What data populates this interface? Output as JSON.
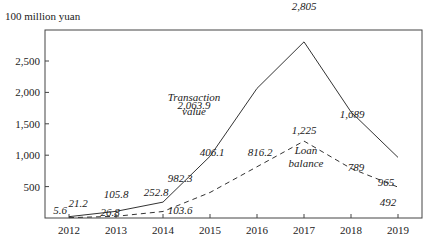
{
  "chart_data": {
    "type": "line",
    "title": "",
    "ylabel": "100 million yuan",
    "xlabel": "",
    "categories": [
      "2012",
      "2013",
      "2014",
      "2015",
      "2016",
      "2017",
      "2018",
      "2019"
    ],
    "yticks": [
      500,
      1000,
      1500,
      2000,
      2500
    ],
    "ytick_labels": [
      "500",
      "1,000",
      "1,500",
      "2,000",
      "2,500"
    ],
    "ylim": [
      0,
      3000
    ],
    "grid": false,
    "legend": "inline annotations",
    "series": [
      {
        "name": "Transaction value",
        "style": "solid",
        "values": [
          21.2,
          105.8,
          252.8,
          982.3,
          2063.9,
          2805,
          1689,
          965
        ],
        "labels": [
          "21.2",
          "105.8",
          "252.8",
          "982.3",
          "2,063.9",
          "2,805",
          "1,689",
          "965"
        ]
      },
      {
        "name": "Loan balance",
        "style": "dashed",
        "values": [
          5.6,
          26.8,
          103.6,
          406.1,
          816.2,
          1225,
          789,
          492
        ],
        "labels": [
          "5.6",
          "26.8",
          "103.6",
          "406.1",
          "816.2",
          "1,225",
          "789",
          "492"
        ]
      }
    ],
    "annotations": [
      {
        "text": [
          "Transaction",
          "value"
        ],
        "series": "Transaction value"
      },
      {
        "text": [
          "Loan",
          "balance"
        ],
        "series": "Loan balance"
      }
    ]
  }
}
